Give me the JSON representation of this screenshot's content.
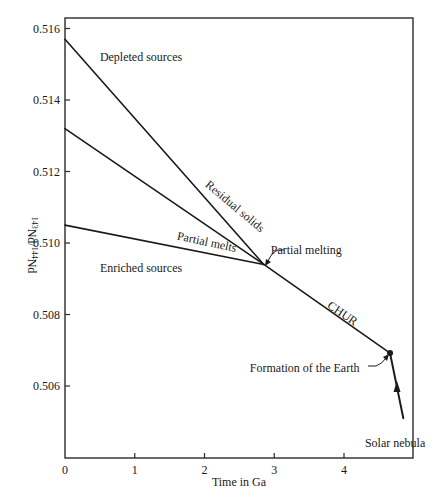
{
  "chart_data": {
    "type": "line",
    "title": "",
    "xlabel": "Time in Ga",
    "ylabel": "143Nd/144Nd",
    "ylabel_parts": {
      "sup1": "143",
      "base1": "Nd/",
      "sup2": "144",
      "base2": "Nd"
    },
    "xlim": [
      0,
      4.99
    ],
    "ylim": [
      0.50399,
      0.51629
    ],
    "x_ticks": [
      0,
      1,
      2,
      3,
      4
    ],
    "x_tick_labels": [
      "0",
      "1",
      "2",
      "3",
      "4"
    ],
    "y_ticks": [
      0.506,
      0.508,
      0.51,
      0.512,
      0.514,
      0.516
    ],
    "y_tick_labels": [
      "0.506",
      "0.508",
      "0.510",
      "0.512",
      "0.514",
      "0.516"
    ],
    "grid": false,
    "legend": null,
    "series": [
      {
        "name": "Residual solids (depleted)",
        "x": [
          0,
          2.85
        ],
        "y": [
          0.5157,
          0.5094
        ]
      },
      {
        "name": "Intermediate",
        "x": [
          0,
          2.85
        ],
        "y": [
          0.5132,
          0.5094
        ]
      },
      {
        "name": "Partial melts (enriched)",
        "x": [
          0,
          2.85
        ],
        "y": [
          0.5105,
          0.5094
        ]
      },
      {
        "name": "CHUR",
        "x": [
          2.85,
          4.66
        ],
        "y": [
          0.5094,
          0.50692
        ]
      },
      {
        "name": "Solar nebula",
        "x": [
          4.66,
          4.85
        ],
        "y": [
          0.50692,
          0.5051
        ]
      }
    ],
    "points": [
      {
        "name": "Formation of the Earth",
        "x": 4.66,
        "y": 0.50692
      }
    ],
    "annotations": [
      {
        "text": "Depleted sources",
        "x": 0.5,
        "y": 0.5151
      },
      {
        "text": "Enriched sources",
        "x": 0.5,
        "y": 0.5092
      },
      {
        "text": "Residual solids",
        "x": 2.0,
        "y": 0.5116,
        "rotation": 40
      },
      {
        "text": "Partial melts",
        "x": 1.6,
        "y": 0.5101,
        "rotation": 12
      },
      {
        "text": "Partial melting",
        "x": 2.95,
        "y": 0.5097
      },
      {
        "text": "CHUR",
        "x": 3.75,
        "y": 0.5082,
        "rotation": 34
      },
      {
        "text": "Formation of the Earth",
        "x": 2.65,
        "y": 0.5064
      },
      {
        "text": "Solar nebula",
        "x": 4.3,
        "y": 0.5043
      }
    ]
  }
}
